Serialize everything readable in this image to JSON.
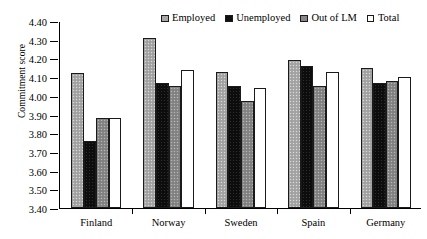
{
  "chart_data": {
    "type": "bar",
    "title": "",
    "xlabel": "",
    "ylabel": "Commitment score",
    "ylim": [
      3.4,
      4.4
    ],
    "ytick_step": 0.1,
    "yticks": [
      "4.40",
      "4.30",
      "4.20",
      "4.10",
      "4.00",
      "3.90",
      "3.80",
      "3.70",
      "3.60",
      "3.50",
      "3.40"
    ],
    "grid": false,
    "legend_position": "top-right",
    "categories": [
      "Finland",
      "Norway",
      "Sweden",
      "Spain",
      "Germany"
    ],
    "series": [
      {
        "name": "Employed",
        "values": [
          4.12,
          4.31,
          4.13,
          4.19,
          4.15
        ]
      },
      {
        "name": "Unemployed",
        "values": [
          3.76,
          4.07,
          4.05,
          4.16,
          4.07
        ]
      },
      {
        "name": "Out of LM",
        "values": [
          3.88,
          4.05,
          3.97,
          4.05,
          4.08
        ]
      },
      {
        "name": "Total",
        "values": [
          3.88,
          4.14,
          4.04,
          4.13,
          4.1
        ]
      }
    ]
  },
  "legend": {
    "items": [
      {
        "label": "Employed"
      },
      {
        "label": "Unemployed"
      },
      {
        "label": "Out of LM"
      },
      {
        "label": "Total"
      }
    ]
  }
}
